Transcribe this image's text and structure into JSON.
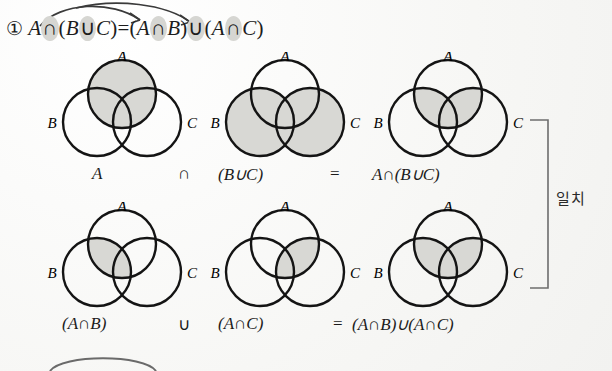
{
  "header": {
    "item_number": "①",
    "equation": {
      "lhs_a": "A",
      "lhs_cap": "∩",
      "lhs_open": "(",
      "lhs_b": "B",
      "lhs_cup": "∪",
      "lhs_c": "C",
      "lhs_close": ")",
      "equals": "=",
      "rhs1_open": "(",
      "rhs1_a": "A",
      "rhs1_cap": "∩",
      "rhs1_b": "B",
      "rhs1_close": ")",
      "rhs_cup": "∪",
      "rhs2_open": "(",
      "rhs2_a": "A",
      "rhs2_cap": "∩",
      "rhs2_c": "C",
      "rhs2_close": ")"
    },
    "arrows_note": "two curved arrows from A to B and from A to C"
  },
  "labels": {
    "set_a": "A",
    "set_b": "B",
    "set_c": "C"
  },
  "rows": [
    {
      "id": "row1",
      "diagrams": [
        {
          "name": "venn-a",
          "shaded": "circle A (full)",
          "caption": "A"
        },
        {
          "name": "venn-b-union-c",
          "shaded": "circles B and C (union)",
          "caption": "(B∪C)"
        },
        {
          "name": "venn-a-cap-b-union-c",
          "shaded": "A ∩ (B∪C)",
          "caption": "A∩(B∪C)"
        }
      ],
      "operator_1": "∩",
      "operator_2": "="
    },
    {
      "id": "row2",
      "diagrams": [
        {
          "name": "venn-a-cap-b",
          "shaded": "A ∩ B lens",
          "caption": "(A∩B)"
        },
        {
          "name": "venn-a-cap-c",
          "shaded": "A ∩ C lens",
          "caption": "(A∩C)"
        },
        {
          "name": "venn-a-cap-b-union-a-cap-c",
          "shaded": "(A∩B) ∪ (A∩C)",
          "caption": "(A∩B)∪(A∩C)"
        }
      ],
      "operator_1": "∪",
      "operator_2": "="
    }
  ],
  "annotation": {
    "match_label": "일치"
  },
  "colors": {
    "shade": "#d8d8d4",
    "stroke": "#141414",
    "background": "#fbfbfa",
    "brace": "#6d6d6d"
  }
}
